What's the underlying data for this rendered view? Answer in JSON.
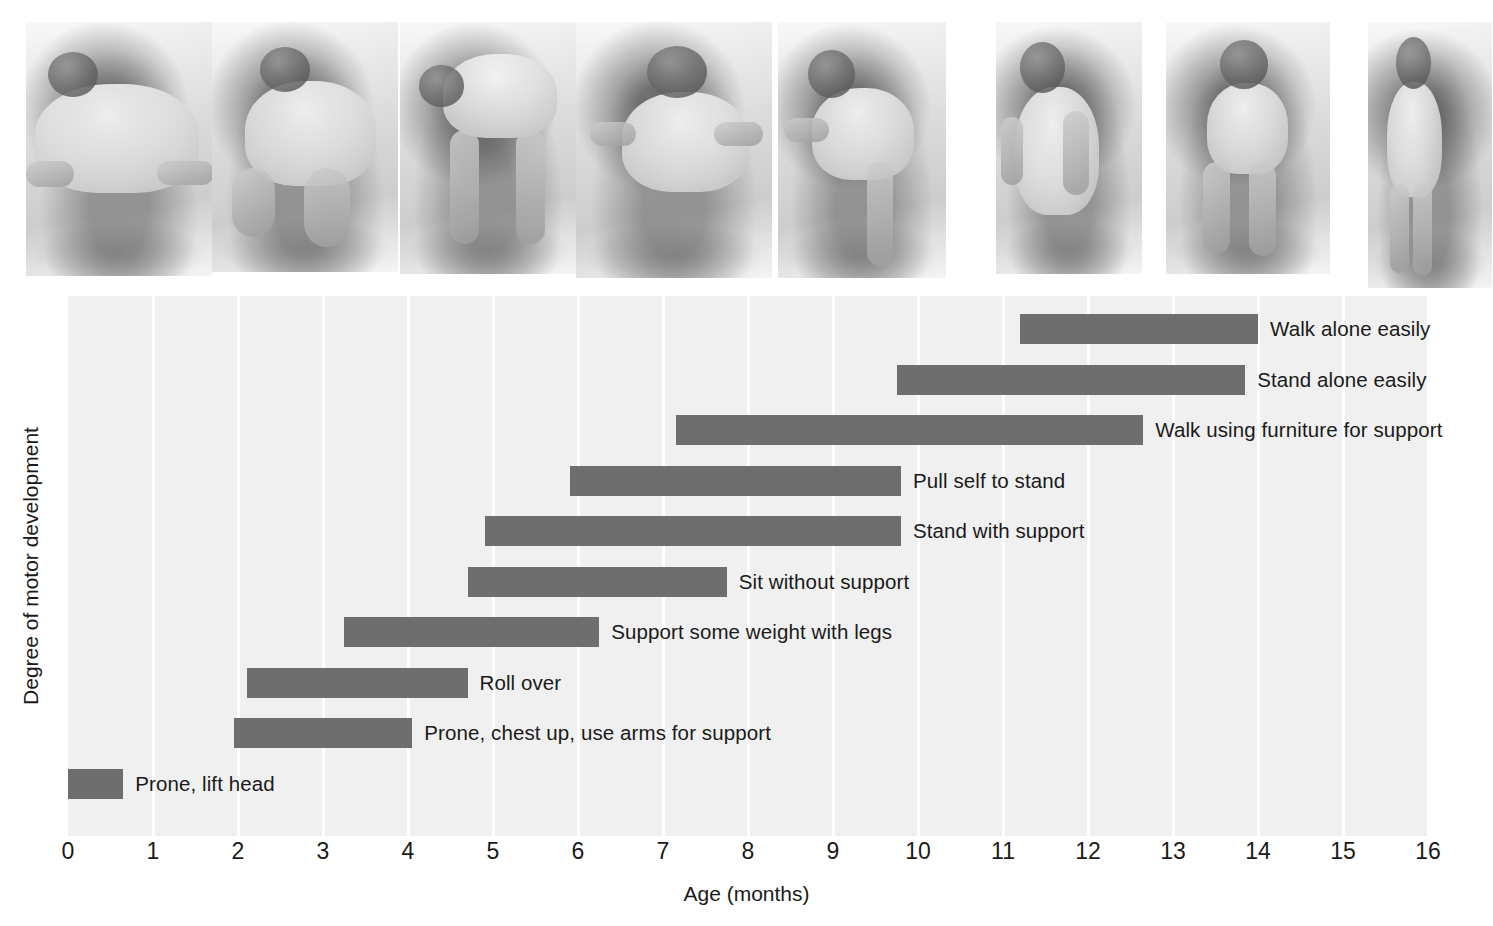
{
  "figure": {
    "photo_strip": {
      "name": "infant-motor-development-photos",
      "count": 8,
      "photos": [
        {
          "alt": "infant prone lifting head and chest, smiling"
        },
        {
          "alt": "infant rolling over on blanket"
        },
        {
          "alt": "infant on hands and knees, crawling position"
        },
        {
          "alt": "infant sitting without support, patterned shirt"
        },
        {
          "alt": "infant pulling self to stand at a low table"
        },
        {
          "alt": "infant standing with support holding a curtain"
        },
        {
          "alt": "infant walking while held by an adult's hands"
        },
        {
          "alt": "toddler walking alone, side view"
        }
      ]
    }
  },
  "chart_data": {
    "type": "bar",
    "orientation": "horizontal",
    "subtype": "range-bar",
    "title": "",
    "xlabel": "Age (months)",
    "ylabel": "Degree of motor development",
    "xlim": [
      0,
      16
    ],
    "xticks": [
      "0",
      "1",
      "2",
      "3",
      "4",
      "5",
      "6",
      "7",
      "8",
      "9",
      "10",
      "11",
      "12",
      "13",
      "14",
      "15",
      "16"
    ],
    "grid": "vertical-white-gridlines-on-light-gray-panel",
    "legend": "none",
    "bar_color": "#6e6e6e",
    "panel_color": "#f0f0f0",
    "gridline_color": "#ffffff",
    "label_color": "#1a1a1a",
    "milestones": [
      {
        "label": "Walk alone easily",
        "start": 11.2,
        "end": 14.0
      },
      {
        "label": "Stand alone easily",
        "start": 9.75,
        "end": 13.85
      },
      {
        "label": "Walk using furniture for support",
        "start": 7.15,
        "end": 12.65
      },
      {
        "label": "Pull self to stand",
        "start": 5.9,
        "end": 9.8
      },
      {
        "label": "Stand with support",
        "start": 4.9,
        "end": 9.8
      },
      {
        "label": "Sit without support",
        "start": 4.7,
        "end": 7.75
      },
      {
        "label": "Support some weight with legs",
        "start": 3.25,
        "end": 6.25
      },
      {
        "label": "Roll over",
        "start": 2.1,
        "end": 4.7
      },
      {
        "label": "Prone, chest up, use arms for support",
        "start": 1.95,
        "end": 4.05
      },
      {
        "label": "Prone, lift head",
        "start": 0.0,
        "end": 0.65
      }
    ]
  }
}
